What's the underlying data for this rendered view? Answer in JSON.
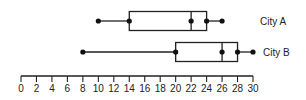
{
  "chart_data": {
    "type": "boxplot",
    "title": "",
    "xlabel": "",
    "ylabel": "",
    "xlim": [
      0,
      30
    ],
    "x_ticks": [
      0,
      2,
      4,
      6,
      8,
      10,
      12,
      14,
      16,
      18,
      20,
      22,
      24,
      26,
      28,
      30
    ],
    "grid": false,
    "series": [
      {
        "name": "City A",
        "min": 10,
        "q1": 14,
        "median": 22,
        "q3": 24,
        "max": 26
      },
      {
        "name": "City B",
        "min": 8,
        "q1": 20,
        "median": 26,
        "q3": 28,
        "max": 30
      }
    ]
  }
}
